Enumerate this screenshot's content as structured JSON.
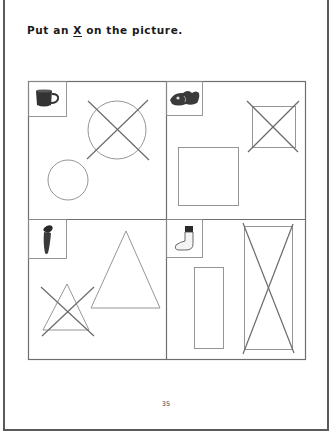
{
  "instruction": {
    "before": "Put an ",
    "letter": "X",
    "after": " on the picture."
  },
  "page_number": "35",
  "colors": {
    "border": "#5a5a5a",
    "grid": "#6e6e6e",
    "shape": "#8a8a8a",
    "cross": "#6a6a6a",
    "icon": "#333333"
  },
  "panels": [
    {
      "id": "cup",
      "icon": "cup-icon",
      "shapes": [
        {
          "type": "circle",
          "size": "large",
          "marked": true
        },
        {
          "type": "circle",
          "size": "small",
          "marked": false
        }
      ]
    },
    {
      "id": "fish",
      "icon": "fish-icon",
      "shapes": [
        {
          "type": "square",
          "size": "small",
          "marked": true
        },
        {
          "type": "square",
          "size": "large",
          "marked": false
        }
      ]
    },
    {
      "id": "carrot",
      "icon": "carrot-icon",
      "shapes": [
        {
          "type": "triangle",
          "size": "small",
          "marked": true
        },
        {
          "type": "triangle",
          "size": "large",
          "marked": false
        }
      ]
    },
    {
      "id": "sock",
      "icon": "sock-icon",
      "shapes": [
        {
          "type": "rectangle",
          "size": "small",
          "marked": false
        },
        {
          "type": "rectangle",
          "size": "large",
          "marked": true
        }
      ]
    }
  ]
}
